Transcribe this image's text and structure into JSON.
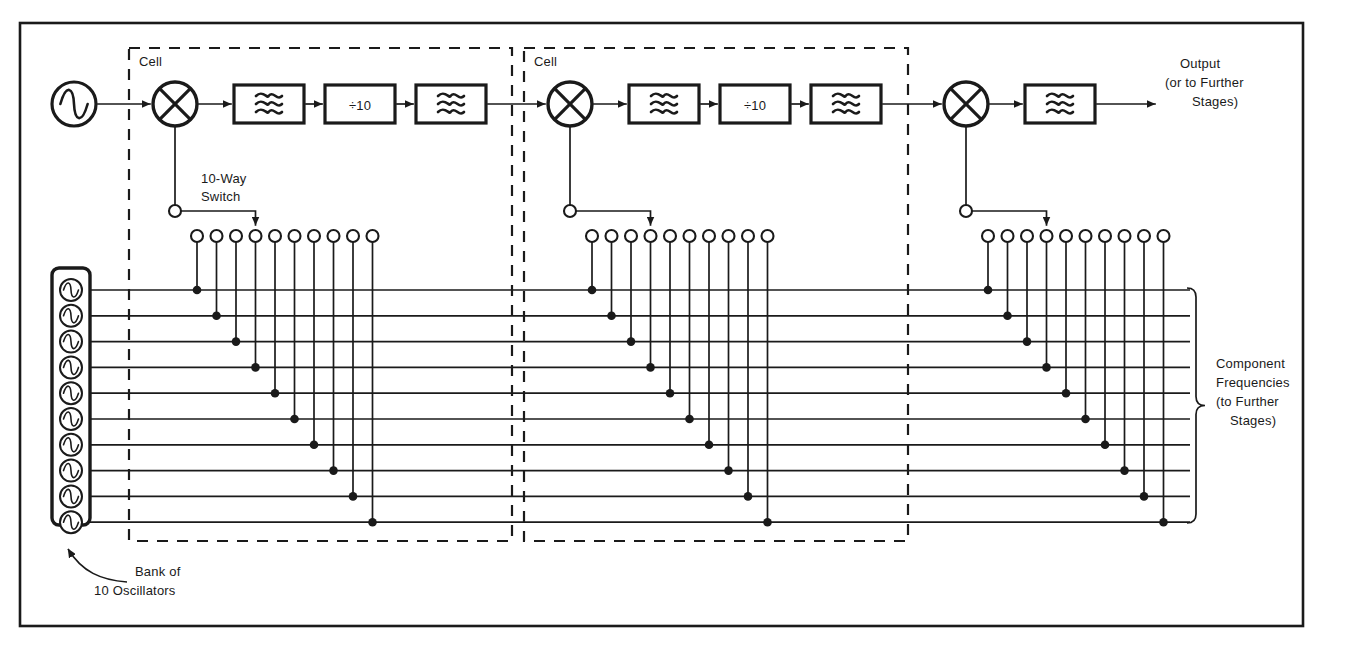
{
  "figure": {
    "background_color": "#ffffff",
    "ink_color": "#1a1a1a",
    "frame": {
      "x": 20,
      "y": 23,
      "width": 1283,
      "height": 603
    }
  },
  "labels": {
    "cell_1": "Cell",
    "cell_2": "Cell",
    "switch_label_line1": "10-Way",
    "switch_label_line2": "Switch",
    "output_line1": "Output",
    "output_line2": "(or to Further",
    "output_line3": "Stages)",
    "bank_line1": "Bank of",
    "bank_line2": "10 Oscillators",
    "component_line1": "Component",
    "component_line2": "Frequencies",
    "component_line3": "(to Further",
    "component_line4": "Stages)",
    "divider_label": "÷10",
    "filter_symbol_name": "wavy-filter-glyph",
    "oscillator_symbol_name": "sine-source-glyph"
  },
  "source_oscillator": {
    "name": "master-source-oscillator",
    "cx": 74,
    "cy": 104,
    "r": 22
  },
  "signal_chain": {
    "stages": [
      {
        "id": "cell-1",
        "cell_box": {
          "x": 129,
          "y": 48,
          "width": 383,
          "height": 493
        },
        "cell_label_x": 139,
        "cell_label_y": 66,
        "mixer": {
          "name": "mixer-1",
          "cx": 175,
          "cy": 104,
          "r": 22
        },
        "blocks": [
          {
            "name": "filter-1a",
            "type": "filter",
            "x": 234,
            "y": 85,
            "width": 70,
            "height": 38
          },
          {
            "name": "divider-1",
            "type": "divider",
            "x": 325,
            "y": 85,
            "width": 70,
            "height": 38,
            "label": "÷10"
          },
          {
            "name": "filter-1b",
            "type": "filter",
            "x": 416,
            "y": 85,
            "width": 70,
            "height": 38
          }
        ],
        "switch": {
          "name": "ten-way-switch-1",
          "pole_x": 175,
          "pole_y": 211,
          "pole_r": 6,
          "wiper_target_index": 3,
          "contacts_start_x": 197,
          "contacts_y": 236,
          "contacts_spacing": 19.5,
          "contact_r": 6,
          "contact_count": 10
        }
      },
      {
        "id": "cell-2",
        "cell_box": {
          "x": 524,
          "y": 48,
          "width": 384,
          "height": 493
        },
        "cell_label_x": 534,
        "cell_label_y": 66,
        "mixer": {
          "name": "mixer-2",
          "cx": 570,
          "cy": 104,
          "r": 22
        },
        "blocks": [
          {
            "name": "filter-2a",
            "type": "filter",
            "x": 629,
            "y": 85,
            "width": 70,
            "height": 38
          },
          {
            "name": "divider-2",
            "type": "divider",
            "x": 720,
            "y": 85,
            "width": 70,
            "height": 38,
            "label": "÷10"
          },
          {
            "name": "filter-2b",
            "type": "filter",
            "x": 811,
            "y": 85,
            "width": 70,
            "height": 38
          }
        ],
        "switch": {
          "name": "ten-way-switch-2",
          "pole_x": 570,
          "pole_y": 211,
          "pole_r": 6,
          "wiper_target_index": 3,
          "contacts_start_x": 592,
          "contacts_y": 236,
          "contacts_spacing": 19.5,
          "contact_r": 6,
          "contact_count": 10
        }
      },
      {
        "id": "output-stage",
        "cell_box": null,
        "mixer": {
          "name": "mixer-3",
          "cx": 966,
          "cy": 104,
          "r": 22
        },
        "blocks": [
          {
            "name": "filter-3",
            "type": "filter",
            "x": 1025,
            "y": 85,
            "width": 70,
            "height": 38
          }
        ],
        "switch": {
          "name": "ten-way-switch-3",
          "pole_x": 966,
          "pole_y": 211,
          "pole_r": 6,
          "wiper_target_index": 3,
          "contacts_start_x": 988,
          "contacts_y": 236,
          "contacts_spacing": 19.5,
          "contact_r": 6,
          "contact_count": 10
        }
      }
    ]
  },
  "oscillator_bank": {
    "name": "bank-of-10-oscillators",
    "count": 10,
    "box": {
      "x": 52,
      "y": 268,
      "width": 38,
      "height": 257,
      "rx": 7
    },
    "symbol_r": 11,
    "bus_start_y": 290,
    "bus_spacing": 25.8,
    "bus_end_x": 1190
  },
  "component_brace": {
    "name": "component-frequencies-brace",
    "x": 1196,
    "y_top": 288,
    "y_bottom": 523,
    "label_x": 1216,
    "label_y": 368
  },
  "bank_callout": {
    "name": "bank-callout-arrow",
    "tip_x": 68,
    "tip_y": 549,
    "tail_x": 127,
    "tail_y": 582,
    "label_x": 135,
    "label_y": 576
  },
  "output_arrow": {
    "name": "output-arrow",
    "from_x": 1095,
    "to_x": 1155,
    "y": 104,
    "label_x": 1180,
    "label_y": 68
  },
  "colors": {
    "ink": "#1a1a1a",
    "paper": "#ffffff"
  }
}
